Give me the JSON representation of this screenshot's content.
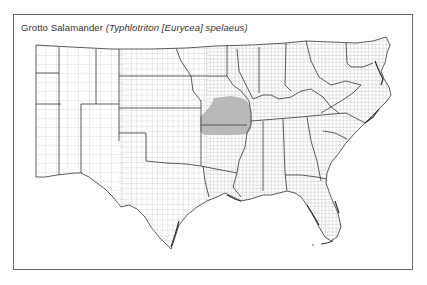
{
  "map": {
    "title": {
      "common_name": "Grotto Salamander",
      "scientific_name": "(Typhlotriton [Eurycea] spelaeus)"
    },
    "region": "Central and Southern United States (county boundaries)",
    "range_fill_color": "#b3b3b3",
    "county_line_color": "#9a9a9a",
    "state_line_color": "#4a4a4a",
    "frame_color": "#6a6a6a"
  }
}
